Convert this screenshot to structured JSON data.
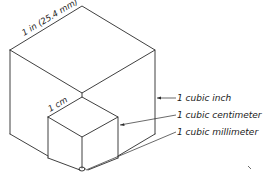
{
  "dimensions": {
    "large_cube_edge": "1 in (25.4 mm)",
    "small_cube_edge": "1 cm"
  },
  "labels": [
    {
      "id": "cubic-inch",
      "text": "1 cubic inch"
    },
    {
      "id": "cubic-centimeter",
      "text": "1 cubic centimeter"
    },
    {
      "id": "cubic-millimeter",
      "text": "1 cubic millimeter"
    }
  ],
  "colors": {
    "line": "#2a2a2a",
    "background": "#ffffff"
  }
}
